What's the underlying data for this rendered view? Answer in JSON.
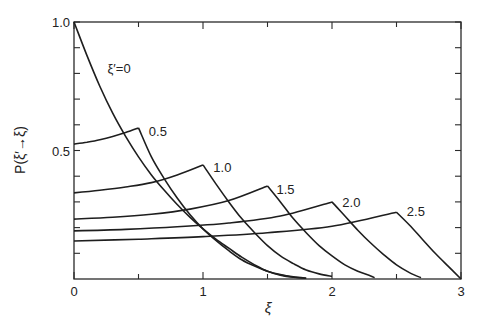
{
  "chart_data": {
    "type": "line",
    "title": "",
    "xlabel": "ξ",
    "ylabel": "P(ξ′→ξ)",
    "xlim": [
      0,
      3
    ],
    "ylim": [
      0,
      1.0
    ],
    "x_ticks_major": [
      0,
      1,
      2,
      3
    ],
    "x_tick_labels": [
      "0",
      "1",
      "2",
      "3"
    ],
    "x_ticks_minor": [
      0.5,
      1.5,
      2.5
    ],
    "y_ticks": [
      0.1,
      0.2,
      0.3,
      0.4,
      0.5,
      0.6,
      0.7,
      0.8,
      0.9,
      1.0
    ],
    "y_tick_labels": [
      {
        "value": 0.5,
        "label": "0.5"
      },
      {
        "value": 1.0,
        "label": "1.0"
      }
    ],
    "grid": false,
    "legend": "inline labels at curve peaks",
    "series": [
      {
        "name": "ξ′=0",
        "label": "ξ′=0",
        "label_pos": [
          0.26,
          0.82
        ],
        "points": [
          [
            0,
            1.0
          ],
          [
            0.1,
            0.87
          ],
          [
            0.2,
            0.75
          ],
          [
            0.3,
            0.645
          ],
          [
            0.4,
            0.555
          ],
          [
            0.5,
            0.475
          ],
          [
            0.6,
            0.405
          ],
          [
            0.7,
            0.345
          ],
          [
            0.8,
            0.29
          ],
          [
            0.9,
            0.24
          ],
          [
            1.0,
            0.195
          ],
          [
            1.1,
            0.155
          ],
          [
            1.2,
            0.12
          ],
          [
            1.3,
            0.085
          ],
          [
            1.4,
            0.055
          ],
          [
            1.5,
            0.03
          ],
          [
            1.6,
            0.015
          ],
          [
            1.7,
            0.007
          ],
          [
            1.8,
            0.003
          ]
        ]
      },
      {
        "name": "ξ′=0.5",
        "label": "0.5",
        "label_pos": [
          0.58,
          0.575
        ],
        "points": [
          [
            0,
            0.525
          ],
          [
            0.1,
            0.532
          ],
          [
            0.2,
            0.542
          ],
          [
            0.3,
            0.555
          ],
          [
            0.4,
            0.57
          ],
          [
            0.5,
            0.588
          ],
          [
            0.6,
            0.475
          ],
          [
            0.7,
            0.39
          ],
          [
            0.8,
            0.315
          ],
          [
            0.9,
            0.25
          ],
          [
            1.0,
            0.195
          ],
          [
            1.1,
            0.15
          ],
          [
            1.2,
            0.11
          ],
          [
            1.3,
            0.075
          ],
          [
            1.4,
            0.05
          ],
          [
            1.5,
            0.03
          ],
          [
            1.6,
            0.017
          ],
          [
            1.7,
            0.008
          ],
          [
            1.8,
            0.003
          ]
        ]
      },
      {
        "name": "ξ′=1.0",
        "label": "1.0",
        "label_pos": [
          1.08,
          0.435
        ],
        "points": [
          [
            0,
            0.335
          ],
          [
            0.2,
            0.345
          ],
          [
            0.4,
            0.358
          ],
          [
            0.6,
            0.375
          ],
          [
            0.8,
            0.405
          ],
          [
            1.0,
            0.444
          ],
          [
            1.1,
            0.37
          ],
          [
            1.2,
            0.3
          ],
          [
            1.3,
            0.235
          ],
          [
            1.4,
            0.18
          ],
          [
            1.5,
            0.13
          ],
          [
            1.6,
            0.09
          ],
          [
            1.7,
            0.06
          ],
          [
            1.8,
            0.035
          ],
          [
            1.9,
            0.02
          ],
          [
            2.0,
            0.01
          ]
        ]
      },
      {
        "name": "ξ′=1.5",
        "label": "1.5",
        "label_pos": [
          1.57,
          0.35
        ],
        "points": [
          [
            0,
            0.233
          ],
          [
            0.3,
            0.24
          ],
          [
            0.6,
            0.252
          ],
          [
            0.9,
            0.272
          ],
          [
            1.2,
            0.305
          ],
          [
            1.5,
            0.362
          ],
          [
            1.6,
            0.3
          ],
          [
            1.7,
            0.235
          ],
          [
            1.8,
            0.18
          ],
          [
            1.9,
            0.13
          ],
          [
            2.0,
            0.09
          ],
          [
            2.1,
            0.055
          ],
          [
            2.2,
            0.03
          ],
          [
            2.3,
            0.012
          ],
          [
            2.33,
            0.005
          ]
        ]
      },
      {
        "name": "ξ′=2.0",
        "label": "2.0",
        "label_pos": [
          2.08,
          0.3
        ],
        "points": [
          [
            0,
            0.187
          ],
          [
            0.4,
            0.193
          ],
          [
            0.8,
            0.203
          ],
          [
            1.2,
            0.218
          ],
          [
            1.6,
            0.245
          ],
          [
            2.0,
            0.3
          ],
          [
            2.1,
            0.245
          ],
          [
            2.2,
            0.19
          ],
          [
            2.3,
            0.14
          ],
          [
            2.4,
            0.095
          ],
          [
            2.5,
            0.055
          ],
          [
            2.6,
            0.025
          ],
          [
            2.69,
            0.005
          ]
        ]
      },
      {
        "name": "ξ′=2.5",
        "label": "2.5",
        "label_pos": [
          2.58,
          0.265
        ],
        "points": [
          [
            0,
            0.148
          ],
          [
            0.5,
            0.155
          ],
          [
            1.0,
            0.165
          ],
          [
            1.5,
            0.18
          ],
          [
            2.0,
            0.205
          ],
          [
            2.5,
            0.26
          ],
          [
            2.6,
            0.21
          ],
          [
            2.7,
            0.155
          ],
          [
            2.8,
            0.1
          ],
          [
            2.9,
            0.05
          ],
          [
            3.0,
            0.0
          ]
        ]
      }
    ]
  }
}
